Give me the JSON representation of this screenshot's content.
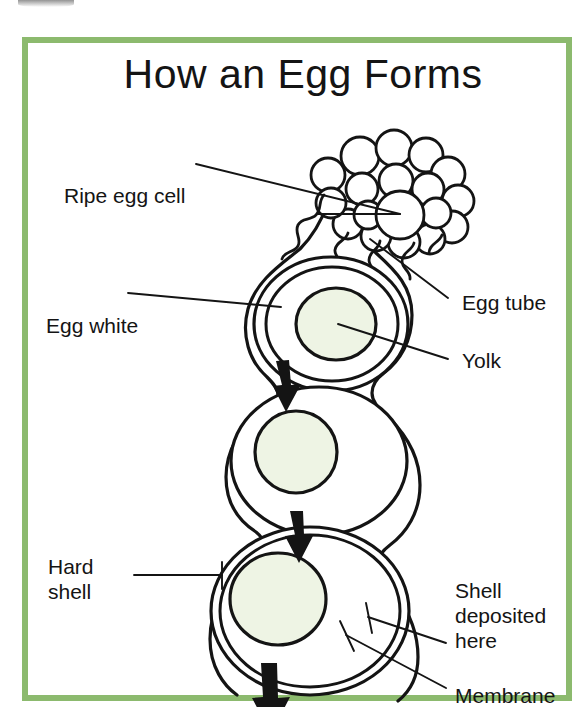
{
  "figure": {
    "title": "How an Egg Forms",
    "border_color": "#8cba6e",
    "background_color": "#ffffff",
    "ink_color": "#141414",
    "yolk_fill_color": "#eef4e4"
  },
  "labels": {
    "ripe_egg_cell": "Ripe egg cell",
    "egg_white": "Egg white",
    "hard_shell": "Hard\nshell",
    "egg_tube": "Egg tube",
    "yolk": "Yolk",
    "shell_deposited_here": "Shell\ndeposited\nhere",
    "membrane": "Membrane"
  },
  "diagram": {
    "type": "labelled-biology-diagram",
    "parts": [
      {
        "name": "ripe-egg-cell",
        "description": "cluster of rounded follicles at the ovary, top right"
      },
      {
        "name": "egg-tube",
        "description": "oviduct tube descending from the ovary"
      },
      {
        "name": "chamber-upper",
        "description": "first egg chamber with yolk surrounded by egg white"
      },
      {
        "name": "chamber-middle",
        "description": "second egg chamber, yolk with more egg white"
      },
      {
        "name": "chamber-lower",
        "description": "third egg chamber with membrane and hard shell layers"
      },
      {
        "name": "flow-arrows",
        "description": "three downward arrows showing the egg travelling down the tube"
      }
    ]
  }
}
